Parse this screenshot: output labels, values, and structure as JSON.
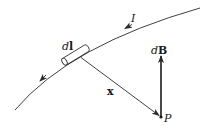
{
  "diagram": {
    "colors": {
      "line": "#2a2a2a",
      "background": "#ffffff"
    },
    "labels": {
      "current": "I",
      "current_element_d": "d",
      "current_element_l": "l",
      "position_vector": "x",
      "field_d": "d",
      "field_B": "B",
      "point": "P"
    },
    "elements": {
      "wire": "curved current-carrying wire with direction arrows",
      "current_element": "small cylinder dl along the wire",
      "position_vector": "arrow x from dl to P",
      "field_vector": "arrow dB pointing upward from P",
      "point": "field point P"
    }
  }
}
